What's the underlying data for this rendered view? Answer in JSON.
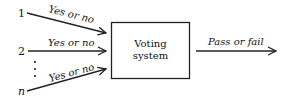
{
  "diagram": {
    "inputs": [
      {
        "label": "1",
        "edge_label": "Yes or no"
      },
      {
        "label": "2",
        "edge_label": "Yes or no"
      },
      {
        "label": "n",
        "edge_label": "Yes or no"
      }
    ],
    "ellipsis": "⋮",
    "box": {
      "line1": "Voting",
      "line2": "system"
    },
    "output": {
      "edge_label": "Pass or fail"
    },
    "colors": {
      "stroke": "#222222",
      "text": "#111111",
      "background": "#ffffff"
    }
  }
}
